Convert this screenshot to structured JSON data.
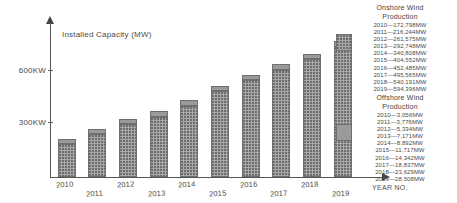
{
  "chart_data": {
    "type": "bar",
    "title": "",
    "axis_title": "Installed Capacity (MW)",
    "xlabel": "YEAR NO.",
    "ylabel": "",
    "categories": [
      "2010",
      "2011",
      "2012",
      "2013",
      "2014",
      "2015",
      "2016",
      "2017",
      "2018",
      "2019"
    ],
    "ytick_labels": [
      "600KW",
      "300KW"
    ],
    "ylim": [
      0,
      700
    ],
    "grid": false,
    "legend_position": "right",
    "stacked": true,
    "series": [
      {
        "name": "Onshore Wind Production",
        "swatch": "hatched-gray",
        "color": "#a8a8a8",
        "values": [
          172798,
          216244,
          261575,
          292748,
          340808,
          404552,
          452485,
          495565,
          540191,
          594396
        ],
        "labels": [
          "2010—172,798MW",
          "2011—216,244MW",
          "2012—261,575MW",
          "2013—292,748MW",
          "2014—340,808MW",
          "2015—404,552MW",
          "2016—452,485MW",
          "2017—495,565MW",
          "2018—540,191MW",
          "2019—594,396MW"
        ]
      },
      {
        "name": "Offshore Wind Production",
        "swatch": "solid-gray",
        "color": "#9a9a9a",
        "values": [
          3056,
          3776,
          5334,
          7171,
          8892,
          11717,
          14342,
          18837,
          23629,
          28508
        ],
        "labels": [
          "2010—3,056MW",
          "2011—3,776MW",
          "2012—5,334MW",
          "2013—7,171MW",
          "2014—8,892MW",
          "2015—11,717MW",
          "2016—14,342MW",
          "2017—18,837MW",
          "2018—23,629MW",
          "2019—28,508MW"
        ]
      }
    ]
  },
  "legend": {
    "onshore_title_line1": "Onshore Wind",
    "onshore_title_line2": "Production",
    "offshore_title_line1": "Offshore Wind",
    "offshore_title_line2": "Production"
  }
}
